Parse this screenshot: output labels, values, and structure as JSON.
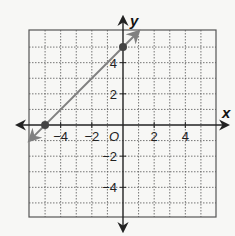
{
  "chart_data": {
    "type": "line",
    "title": "",
    "xlabel": "x",
    "ylabel": "y",
    "origin_label": "O",
    "xlim": [
      -6,
      6
    ],
    "ylim": [
      -6,
      6
    ],
    "grid": true,
    "grid_style": "dotted",
    "x_ticks": [
      -4,
      -2,
      2,
      4
    ],
    "y_ticks": [
      4,
      2,
      -2,
      -4
    ],
    "x_tick_labels": [
      "−4",
      "−2",
      "2",
      "4"
    ],
    "y_tick_labels": [
      "4",
      "2",
      "−2",
      "−4"
    ],
    "series": [
      {
        "name": "line",
        "equation": "y = x + 5",
        "x": [
          -6,
          1
        ],
        "y": [
          -1,
          6
        ],
        "arrows_both_ends": true,
        "color": "#808080"
      }
    ],
    "points": [
      {
        "x": -5,
        "y": 0,
        "label": "x-intercept"
      },
      {
        "x": 0,
        "y": 5,
        "label": "y-intercept"
      }
    ]
  },
  "colors": {
    "grid": "#555555",
    "axis": "#333333",
    "line": "#808080",
    "point": "#444444"
  }
}
